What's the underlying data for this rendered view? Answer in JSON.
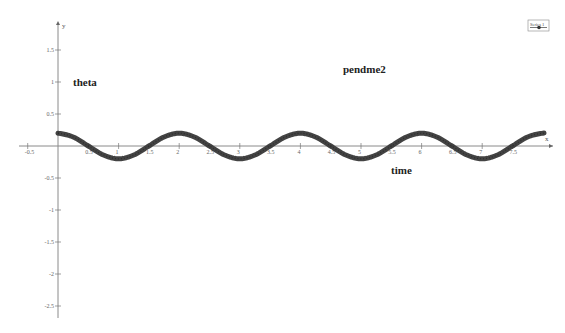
{
  "chart_data": {
    "type": "line",
    "title": "pendme2",
    "xlabel": "time",
    "ylabel": "theta",
    "x_axis_symbol": "x",
    "y_axis_symbol": "y",
    "xlim": [
      -0.6,
      8.2
    ],
    "ylim": [
      -2.7,
      1.9
    ],
    "x_ticks": [
      -0.5,
      0.5,
      1,
      1.5,
      2,
      2.5,
      3,
      3.5,
      4,
      4.5,
      5,
      5.5,
      6,
      6.5,
      7,
      7.5
    ],
    "x_tick_labels": [
      "-0.5",
      "0.5",
      "1",
      "1.5",
      "2",
      "2.5",
      "3",
      "3.5",
      "4",
      "4.5",
      "5",
      "5.5",
      "6",
      "6.5",
      "7",
      "7.5"
    ],
    "y_ticks": [
      1.5,
      1,
      0.5,
      -0.5,
      -1,
      -1.5,
      -2,
      -2.5
    ],
    "y_tick_labels": [
      "1.5",
      "1",
      "0.5",
      "-0.5",
      "-1",
      "-1.5",
      "-2",
      "-2.5"
    ],
    "grid": false,
    "legend_position": "top-right",
    "series": [
      {
        "name": "Series 1",
        "color": "#333333",
        "marker": "circle",
        "description": "damped-free oscillation approx 0.2*cos(pi*t)",
        "x": [
          0,
          0.25,
          0.5,
          0.75,
          1,
          1.25,
          1.5,
          1.75,
          2,
          2.25,
          2.5,
          2.75,
          3,
          3.25,
          3.5,
          3.75,
          4,
          4.25,
          4.5,
          4.75,
          5,
          5.25,
          5.5,
          5.75,
          6,
          6.25,
          6.5,
          6.75,
          7,
          7.25,
          7.5,
          7.75,
          8
        ],
        "values": [
          0.2,
          0.141,
          0,
          -0.141,
          -0.2,
          -0.141,
          0,
          0.141,
          0.2,
          0.141,
          0,
          -0.141,
          -0.2,
          -0.141,
          0,
          0.141,
          0.2,
          0.141,
          0,
          -0.141,
          -0.2,
          -0.141,
          0,
          0.141,
          0.2,
          0.141,
          0,
          -0.141,
          -0.2,
          -0.141,
          0,
          0.141,
          0.2
        ]
      }
    ],
    "annotations": [
      {
        "text": "theta",
        "x": 0.25,
        "y": 0.98
      },
      {
        "text": "pendme2",
        "x": 4.6,
        "y": 1.1
      },
      {
        "text": "time",
        "x": 5.4,
        "y": -0.4
      }
    ]
  }
}
